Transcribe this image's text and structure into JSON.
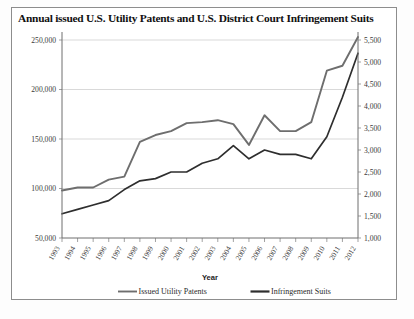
{
  "chart_data": {
    "type": "line",
    "title": "Annual issued U.S. Utility Patents and U.S. District Court Infringement Suits",
    "xlabel": "Year",
    "ylabel": "",
    "grid": true,
    "legend_position": "bottom",
    "categories": [
      "1993",
      "1994",
      "1995",
      "1996",
      "1997",
      "1998",
      "1999",
      "2000",
      "2001",
      "2002",
      "2003",
      "2004",
      "2005",
      "2006",
      "2007",
      "2008",
      "2009",
      "2010",
      "2011",
      "2012"
    ],
    "axes": {
      "left": {
        "label": "",
        "ticks": [
          "50,000",
          "100,000",
          "150,000",
          "200,000",
          "250,000"
        ],
        "tick_values": [
          50000,
          100000,
          150000,
          200000,
          250000
        ],
        "min": 50000,
        "max": 250000
      },
      "right": {
        "label": "",
        "ticks": [
          "1,000",
          "1,500",
          "2,000",
          "2,500",
          "3,000",
          "3,500",
          "4,000",
          "4,500",
          "5,000",
          "5,500"
        ],
        "tick_values": [
          1000,
          1500,
          2000,
          2500,
          3000,
          3500,
          4000,
          4500,
          5000,
          5500
        ],
        "min": 1000,
        "max": 5500
      }
    },
    "series": [
      {
        "name": "Issued Utility Patents",
        "axis": "left",
        "color": "#6e6e6e",
        "values": [
          98000,
          101000,
          101000,
          109000,
          112000,
          147000,
          154000,
          158000,
          166000,
          167000,
          169000,
          165000,
          144000,
          174000,
          158000,
          158000,
          167000,
          219000,
          224000,
          253000
        ]
      },
      {
        "name": "Infringement Suits",
        "axis": "right",
        "color": "#2e2e2e",
        "values": [
          1550,
          1650,
          1750,
          1850,
          2100,
          2300,
          2350,
          2500,
          2500,
          2700,
          2800,
          3100,
          2800,
          3000,
          2900,
          2900,
          2800,
          3300,
          4200,
          5200
        ]
      }
    ]
  },
  "legend": {
    "items": [
      {
        "label": "Issued Utility Patents",
        "color": "#6e6e6e"
      },
      {
        "label": "Infringement Suits",
        "color": "#2e2e2e"
      }
    ]
  }
}
